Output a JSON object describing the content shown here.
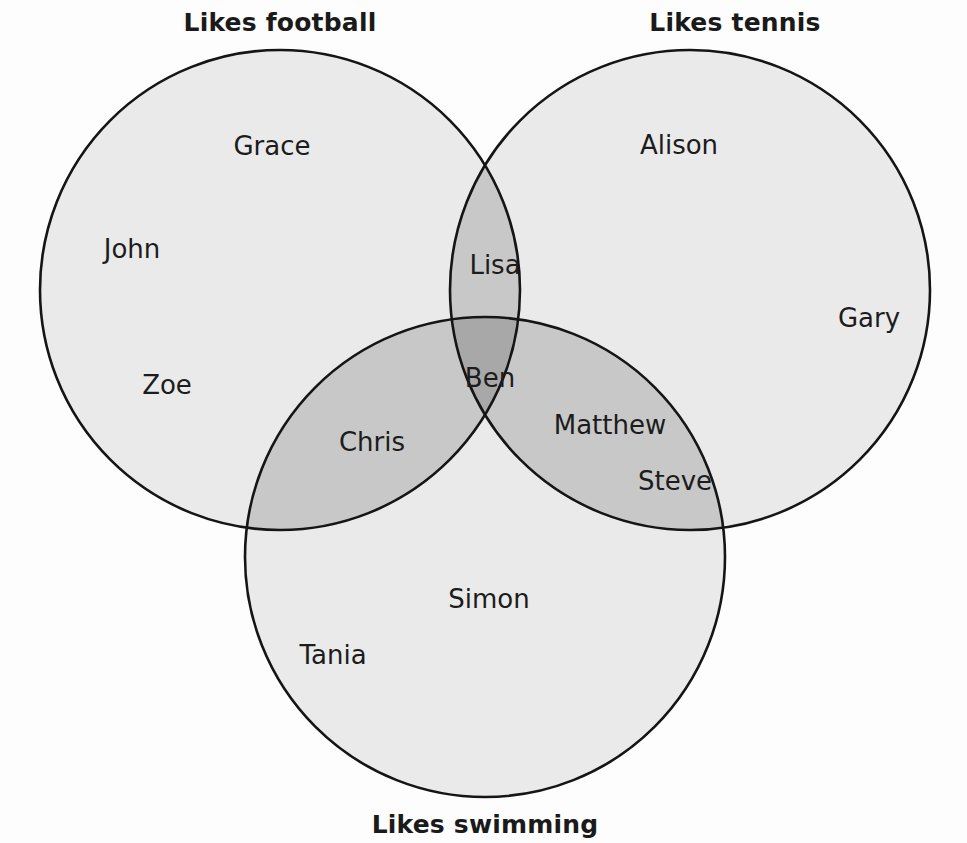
{
  "diagram": {
    "kind": "venn-3-set",
    "background_color": "#fdfdfd",
    "stroke_color": "#151515",
    "fill_single": "#eaeaea",
    "fill_double": "#c8c8c8",
    "fill_triple": "#a8a8a8"
  },
  "titles": {
    "football": "Likes football",
    "tennis": "Likes tennis",
    "swimming": "Likes swimming"
  },
  "sets": {
    "football": {
      "label": "Likes football",
      "cx": 280,
      "cy": 290,
      "r": 240
    },
    "tennis": {
      "label": "Likes tennis",
      "cx": 690,
      "cy": 290,
      "r": 240
    },
    "swimming": {
      "label": "Likes swimming",
      "cx": 485,
      "cy": 557,
      "r": 240
    }
  },
  "regions": {
    "football_only": {
      "label": "Likes football only",
      "members": [
        "Grace",
        "John",
        "Zoe"
      ]
    },
    "tennis_only": {
      "label": "Likes tennis only",
      "members": [
        "Alison",
        "Gary"
      ]
    },
    "swimming_only": {
      "label": "Likes swimming only",
      "members": [
        "Simon",
        "Tania"
      ]
    },
    "football_tennis": {
      "label": "Likes football and tennis",
      "members": [
        "Lisa"
      ]
    },
    "football_swimming": {
      "label": "Likes football and swimming",
      "members": [
        "Chris"
      ]
    },
    "tennis_swimming": {
      "label": "Likes tennis and swimming",
      "members": [
        "Matthew",
        "Steve"
      ]
    },
    "all_three": {
      "label": "Likes football, tennis and swimming",
      "members": [
        "Ben"
      ]
    }
  },
  "names": {
    "grace": "Grace",
    "john": "John",
    "zoe": "Zoe",
    "alison": "Alison",
    "gary": "Gary",
    "lisa": "Lisa",
    "ben": "Ben",
    "chris": "Chris",
    "matthew": "Matthew",
    "steve": "Steve",
    "simon": "Simon",
    "tania": "Tania"
  }
}
